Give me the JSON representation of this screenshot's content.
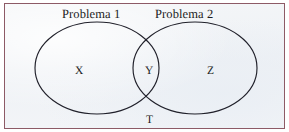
{
  "figure": {
    "kind": "venn-diagram",
    "caption_labels": {
      "left_set_title": "Problema 1",
      "right_set_title": "Problema 2"
    },
    "regions": [
      {
        "id": "x",
        "label": "X",
        "meaning": "left-only"
      },
      {
        "id": "y",
        "label": "Y",
        "meaning": "intersection"
      },
      {
        "id": "z",
        "label": "Z",
        "meaning": "right-only"
      },
      {
        "id": "t",
        "label": "T",
        "meaning": "universe"
      }
    ],
    "colors": {
      "frame_border": "#8d5a66",
      "paper_background": "#f1f3f6",
      "outline_stroke": "#20202a",
      "text": "#1b1b22",
      "outer_margin": "#ffffff"
    },
    "geometry": {
      "left_ellipse": {
        "cx": 92,
        "cy": 64,
        "rx": 62,
        "ry": 46
      },
      "right_ellipse": {
        "cx": 190,
        "cy": 64,
        "rx": 62,
        "ry": 46
      }
    }
  }
}
